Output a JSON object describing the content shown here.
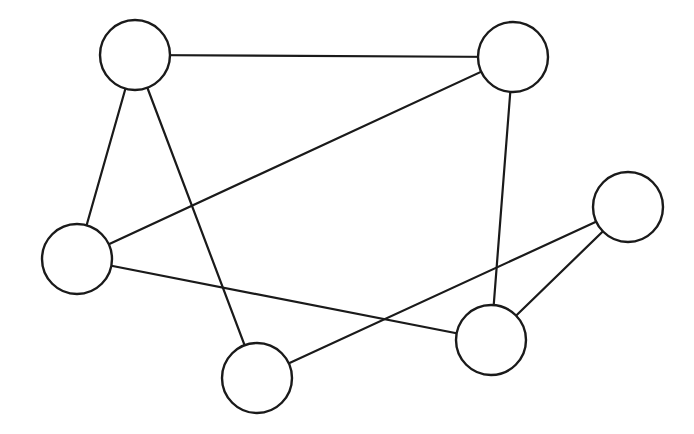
{
  "diagram": {
    "type": "undirected-graph",
    "background": "#ffffff",
    "stroke_color": "#1a1a1a",
    "node_radius": 35,
    "nodes": [
      {
        "id": "A",
        "x": 135,
        "y": 55
      },
      {
        "id": "B",
        "x": 513,
        "y": 57
      },
      {
        "id": "C",
        "x": 77,
        "y": 259
      },
      {
        "id": "D",
        "x": 628,
        "y": 207
      },
      {
        "id": "E",
        "x": 257,
        "y": 378
      },
      {
        "id": "F",
        "x": 491,
        "y": 340
      }
    ],
    "edges": [
      {
        "from": "A",
        "to": "B"
      },
      {
        "from": "A",
        "to": "C"
      },
      {
        "from": "A",
        "to": "E"
      },
      {
        "from": "C",
        "to": "B"
      },
      {
        "from": "B",
        "to": "F"
      },
      {
        "from": "C",
        "to": "F"
      },
      {
        "from": "E",
        "to": "D"
      },
      {
        "from": "F",
        "to": "D"
      }
    ]
  }
}
